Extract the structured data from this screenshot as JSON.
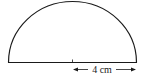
{
  "figure": {
    "shape": "semicircle",
    "radius_label": "4 cm",
    "stroke_color": "#1a1a1a",
    "background": "#ffffff"
  }
}
